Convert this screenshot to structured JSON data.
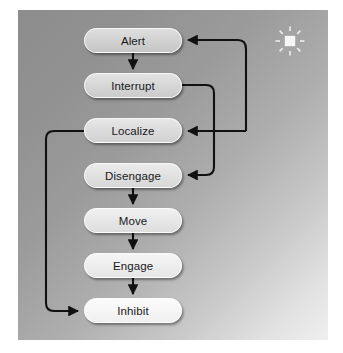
{
  "diagram": {
    "panel": {
      "background_from": "#8d8d8d",
      "background_to": "#efefef"
    },
    "nodes": [
      {
        "id": "alert",
        "label": "Alert",
        "x": 84,
        "y": 28,
        "w": 98,
        "h": 25
      },
      {
        "id": "interrupt",
        "label": "Interrupt",
        "x": 84,
        "y": 73,
        "w": 98,
        "h": 25
      },
      {
        "id": "localize",
        "label": "Localize",
        "x": 84,
        "y": 118,
        "w": 98,
        "h": 25
      },
      {
        "id": "disengage",
        "label": "Disengage",
        "x": 84,
        "y": 163,
        "w": 98,
        "h": 25
      },
      {
        "id": "move",
        "label": "Move",
        "x": 84,
        "y": 208,
        "w": 98,
        "h": 25
      },
      {
        "id": "engage",
        "label": "Engage",
        "x": 84,
        "y": 253,
        "w": 98,
        "h": 25
      },
      {
        "id": "inhibit",
        "label": "Inhibit",
        "x": 84,
        "y": 298,
        "w": 98,
        "h": 25
      }
    ],
    "edges": [
      {
        "from": "alert",
        "to": "interrupt",
        "kind": "straight-down",
        "arrow": true
      },
      {
        "from": "disengage",
        "to": "move",
        "kind": "straight-down",
        "arrow": true
      },
      {
        "from": "move",
        "to": "engage",
        "kind": "straight-down",
        "arrow": true
      },
      {
        "from": "engage",
        "to": "inhibit",
        "kind": "straight-down",
        "arrow": true
      },
      {
        "from": "interrupt",
        "to": "disengage",
        "kind": "right-loop-inner",
        "arrow": true
      },
      {
        "from": "localize",
        "to": "alert",
        "kind": "right-loop-outer",
        "arrow": true
      },
      {
        "from": "interrupt",
        "to": "localize",
        "kind": "right-loop-outer",
        "arrow": true
      },
      {
        "from": "localize",
        "to": "inhibit",
        "kind": "left-loop",
        "arrow": true
      }
    ],
    "stroke_color": "#111111",
    "icon": {
      "name": "sparkle-icon",
      "color": "#f2f2f2",
      "rays": 8
    }
  }
}
